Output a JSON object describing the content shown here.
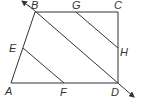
{
  "diagram": {
    "type": "geometry",
    "colors": {
      "line": "#333333",
      "background": "#ffffff"
    },
    "points": {
      "A": {
        "label": "A",
        "x": 11,
        "y": 83
      },
      "B": {
        "label": "B",
        "x": 35,
        "y": 12
      },
      "C": {
        "label": "C",
        "x": 118,
        "y": 12
      },
      "D": {
        "label": "D",
        "x": 118,
        "y": 83
      },
      "E": {
        "label": "E",
        "x": 23,
        "y": 48
      },
      "F": {
        "label": "F",
        "x": 64,
        "y": 83
      },
      "G": {
        "label": "G",
        "x": 76,
        "y": 12
      },
      "H": {
        "label": "H",
        "x": 118,
        "y": 48
      }
    },
    "segments": [
      "AB",
      "BC",
      "CD",
      "DA",
      "EF",
      "GH"
    ],
    "line": "BD (extended, arrows both ends)"
  }
}
